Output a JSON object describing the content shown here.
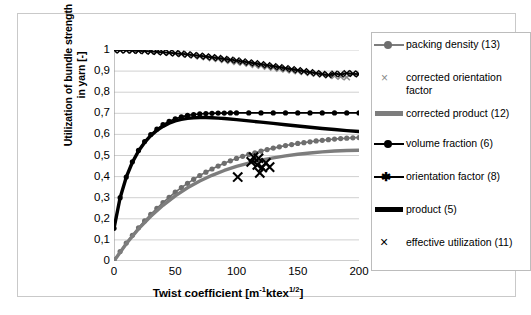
{
  "chart_data": {
    "type": "line",
    "title": "",
    "xlabel": "Twist coefficient [m-1ktex1/2]",
    "ylabel": "Utilization of bundle strength in yarn [-]",
    "xlim": [
      0,
      200
    ],
    "ylim": [
      0,
      1
    ],
    "grid": "horizontal",
    "legend_position": "right",
    "xticks": [
      "0",
      "50",
      "100",
      "150",
      "200"
    ],
    "xtick_values": [
      0,
      50,
      100,
      150,
      200
    ],
    "yticks": [
      "0",
      "0,1",
      "0,2",
      "0,3",
      "0,4",
      "0,5",
      "0,6",
      "0,7",
      "0,8",
      "0,9",
      "1"
    ],
    "ytick_values": [
      0,
      0.1,
      0.2,
      0.3,
      0.4,
      0.5,
      0.6,
      0.7,
      0.8,
      0.9,
      1.0
    ],
    "series": [
      {
        "name": "packing density (13)",
        "style": "line+circle",
        "color": "#6e6e6e",
        "x": [
          0,
          5,
          10,
          15,
          20,
          25,
          30,
          35,
          40,
          45,
          50,
          55,
          60,
          65,
          70,
          75,
          80,
          85,
          90,
          95,
          100,
          105,
          110,
          115,
          120,
          125,
          130,
          135,
          140,
          145,
          150,
          155,
          160,
          165,
          170,
          175,
          180,
          185,
          190,
          195,
          200
        ],
        "values": [
          0.005,
          0.045,
          0.085,
          0.122,
          0.157,
          0.19,
          0.221,
          0.25,
          0.277,
          0.302,
          0.326,
          0.348,
          0.368,
          0.387,
          0.405,
          0.421,
          0.436,
          0.45,
          0.463,
          0.475,
          0.486,
          0.496,
          0.505,
          0.513,
          0.521,
          0.528,
          0.535,
          0.541,
          0.547,
          0.552,
          0.557,
          0.561,
          0.565,
          0.569,
          0.572,
          0.575,
          0.578,
          0.58,
          0.582,
          0.584,
          0.585
        ]
      },
      {
        "name": "corrected orientation factor",
        "style": "line+cross",
        "color": "#8a8a8a",
        "x": [
          0,
          5,
          10,
          15,
          20,
          25,
          30,
          35,
          40,
          45,
          50,
          55,
          60,
          65,
          70,
          75,
          80,
          85,
          90,
          95,
          100,
          105,
          110,
          115,
          120,
          125,
          130,
          135,
          140,
          145,
          150,
          155,
          160,
          165,
          170,
          175,
          180,
          185,
          190,
          195,
          200
        ],
        "values": [
          1.0,
          0.9995,
          0.999,
          0.998,
          0.997,
          0.996,
          0.994,
          0.992,
          0.99,
          0.987,
          0.984,
          0.981,
          0.978,
          0.974,
          0.97,
          0.966,
          0.962,
          0.958,
          0.953,
          0.949,
          0.944,
          0.94,
          0.935,
          0.93,
          0.926,
          0.921,
          0.917,
          0.912,
          0.908,
          0.904,
          0.9,
          0.896,
          0.892,
          0.888,
          0.884,
          0.881,
          0.877,
          0.874,
          0.871,
          0.888,
          0.885
        ]
      },
      {
        "name": "corrected product (12)",
        "style": "thick-line",
        "color": "#7d7d7d",
        "x": [
          0,
          10,
          20,
          30,
          40,
          50,
          60,
          70,
          80,
          90,
          100,
          110,
          120,
          130,
          140,
          150,
          160,
          170,
          180,
          190,
          200
        ],
        "values": [
          0.0,
          0.082,
          0.152,
          0.212,
          0.264,
          0.309,
          0.347,
          0.379,
          0.406,
          0.429,
          0.448,
          0.464,
          0.478,
          0.489,
          0.498,
          0.506,
          0.512,
          0.517,
          0.521,
          0.524,
          0.525
        ]
      },
      {
        "name": "volume fraction (6)",
        "style": "line+circle",
        "color": "#000000",
        "x": [
          0,
          5,
          10,
          15,
          20,
          25,
          30,
          35,
          40,
          45,
          50,
          55,
          60,
          65,
          70,
          75,
          80,
          85,
          90,
          95,
          100,
          110,
          120,
          130,
          140,
          150,
          160,
          170,
          180,
          190,
          200
        ],
        "values": [
          0.155,
          0.3,
          0.398,
          0.47,
          0.524,
          0.566,
          0.599,
          0.625,
          0.646,
          0.662,
          0.674,
          0.683,
          0.69,
          0.694,
          0.697,
          0.699,
          0.7,
          0.701,
          0.701,
          0.702,
          0.702,
          0.702,
          0.702,
          0.702,
          0.702,
          0.702,
          0.702,
          0.702,
          0.702,
          0.702,
          0.702
        ]
      },
      {
        "name": "orientation factor (8)",
        "style": "line+star",
        "color": "#000000",
        "x": [
          0,
          5,
          10,
          15,
          20,
          25,
          30,
          35,
          40,
          45,
          50,
          55,
          60,
          65,
          70,
          75,
          80,
          85,
          90,
          95,
          100,
          105,
          110,
          115,
          120,
          125,
          130,
          135,
          140,
          145,
          150,
          155,
          160,
          165,
          170,
          175,
          180,
          185,
          190,
          195,
          200
        ],
        "values": [
          1.0,
          0.9993,
          0.9985,
          0.9975,
          0.9962,
          0.9948,
          0.9932,
          0.9913,
          0.9892,
          0.9869,
          0.9844,
          0.9817,
          0.9788,
          0.9757,
          0.9724,
          0.969,
          0.9654,
          0.9617,
          0.9578,
          0.9538,
          0.9497,
          0.9455,
          0.9412,
          0.9368,
          0.9323,
          0.9278,
          0.9232,
          0.9186,
          0.9139,
          0.9092,
          0.9045,
          0.8998,
          0.8951,
          0.8904,
          0.8857,
          0.881,
          0.888,
          0.885,
          0.89,
          0.887,
          0.886
        ]
      },
      {
        "name": "product (5)",
        "style": "thick-line",
        "color": "#000000",
        "x": [
          0,
          5,
          10,
          15,
          20,
          25,
          30,
          35,
          40,
          45,
          50,
          55,
          60,
          65,
          70,
          75,
          80,
          85,
          90,
          100,
          110,
          120,
          130,
          140,
          150,
          160,
          170,
          180,
          190,
          200
        ],
        "values": [
          0.155,
          0.3,
          0.397,
          0.468,
          0.521,
          0.562,
          0.594,
          0.619,
          0.638,
          0.653,
          0.664,
          0.671,
          0.676,
          0.679,
          0.68,
          0.68,
          0.679,
          0.677,
          0.675,
          0.67,
          0.664,
          0.658,
          0.652,
          0.646,
          0.64,
          0.634,
          0.628,
          0.623,
          0.618,
          0.614
        ]
      },
      {
        "name": "effective utilization (11)",
        "style": "scatter-cross",
        "color": "#000000",
        "x": [
          101,
          112,
          114,
          117,
          118,
          119,
          121,
          124,
          127
        ],
        "values": [
          0.398,
          0.47,
          0.492,
          0.455,
          0.487,
          0.418,
          0.443,
          0.465,
          0.445
        ]
      }
    ]
  },
  "axes": {
    "y_title_line1": "Utilization of bundle strength",
    "y_title_line2": "in yarn [-]",
    "x_title_main": "Twist coefficient [m",
    "x_title_sup1": "-1",
    "x_title_mid": "ktex",
    "x_title_sup2": "1/2",
    "x_title_end": "]"
  },
  "legend": {
    "items": [
      {
        "label": "packing density (13)",
        "marker": "gray-line-circle"
      },
      {
        "label": "corrected orientation factor",
        "marker": "gray-cross"
      },
      {
        "label": "corrected product (12)",
        "marker": "gray-thick-line"
      },
      {
        "label": "volume fraction (6)",
        "marker": "black-line-circle"
      },
      {
        "label": "orientation factor (8)",
        "marker": "black-line-star"
      },
      {
        "label": "product (5)",
        "marker": "black-thick-line"
      },
      {
        "label": "effective utilization (11)",
        "marker": "black-cross"
      }
    ]
  }
}
